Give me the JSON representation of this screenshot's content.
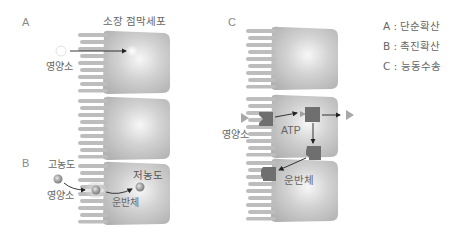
{
  "title": "소장 점막세포",
  "panels": {
    "A": {
      "letter": "A",
      "nutrient_label": "영양소"
    },
    "B": {
      "letter": "B",
      "high_conc_label": "고농도",
      "nutrient_label": "영양소",
      "low_conc_label": "저농도",
      "carrier_label": "운반체"
    },
    "C": {
      "letter": "C",
      "nutrient_label": "영양소",
      "atp_label": "ATP",
      "carrier_label": "운반체"
    }
  },
  "legend": {
    "items": [
      {
        "key": "A",
        "sep": " : ",
        "value": "단순확산"
      },
      {
        "key": "B",
        "sep": " : ",
        "value": "촉진확산"
      },
      {
        "key": "C",
        "sep": " : ",
        "value": "능동수송"
      }
    ]
  },
  "colors": {
    "cell_body": "#b9b9b9",
    "cell_highlight": "#f4f4f4",
    "carrier": "#707070",
    "arrow": "#222222",
    "triangle": "#a8a8a8"
  }
}
